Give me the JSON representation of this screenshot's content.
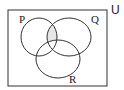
{
  "diagram": {
    "type": "venn",
    "universe_label": "U",
    "sets": [
      {
        "label": "P"
      },
      {
        "label": "Q"
      },
      {
        "label": "R"
      }
    ],
    "shaded_region": "P ∩ Q ∩ R'",
    "colors": {
      "stroke": "#333333",
      "shade": "#e6e6e6",
      "background": "#ffffff"
    }
  }
}
